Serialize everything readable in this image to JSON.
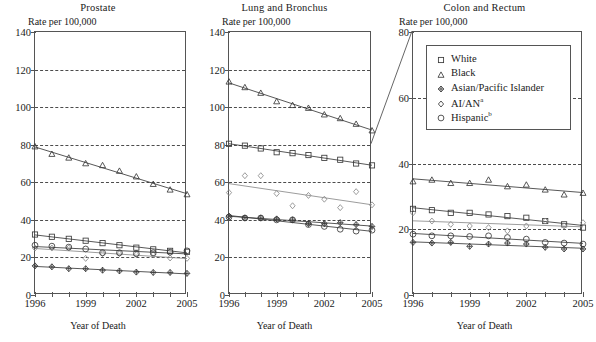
{
  "figure": {
    "width": 596,
    "height": 342,
    "axis_note": "Rate per 100,000",
    "xlabel": "Year of Death",
    "callout": "zoom-connector-lung-to-colon"
  },
  "legend": {
    "position": "top-right-inside-colon-panel",
    "items": [
      {
        "label": "White",
        "marker": "square",
        "key": "white"
      },
      {
        "label": "Black",
        "marker": "triangle",
        "key": "black"
      },
      {
        "label": "Asian/Pacific Islander",
        "marker": "diamond-cross",
        "key": "api"
      },
      {
        "label": "AI/AN",
        "marker": "diamond-small",
        "key": "aian",
        "footnote": "a"
      },
      {
        "label": "Hispanic",
        "marker": "circle",
        "key": "hispanic",
        "footnote": "b"
      }
    ]
  },
  "chart_data": [
    {
      "type": "line",
      "title": "Prostate",
      "xlabel": "Year of Death",
      "ylabel": "Rate per 100,000",
      "x": [
        1996,
        1997,
        1998,
        1999,
        2000,
        2001,
        2002,
        2003,
        2004,
        2005
      ],
      "xticks": [
        1996,
        1999,
        2002,
        2005
      ],
      "xlim": [
        1996,
        2005
      ],
      "ylim": [
        0,
        140
      ],
      "yticks": [
        0,
        20,
        40,
        60,
        80,
        100,
        120,
        140
      ],
      "grid": "horizontal-dashed-at-20-40-60-80-100-120",
      "series": [
        {
          "name": "White",
          "values": [
            32.2,
            31.0,
            29.9,
            28.9,
            27.6,
            26.5,
            25.2,
            24.3,
            23.5,
            23.0
          ]
        },
        {
          "name": "Black",
          "values": [
            79.0,
            75.0,
            73.0,
            70.0,
            69.0,
            66.0,
            63.0,
            59.0,
            56.0,
            53.5
          ]
        },
        {
          "name": "Asian/Pacific Islander",
          "values": [
            15.5,
            15.0,
            14.0,
            14.0,
            13.2,
            12.8,
            12.2,
            12.0,
            12.0,
            11.5
          ]
        },
        {
          "name": "AI/AN",
          "values": [
            25.0,
            25.0,
            25.0,
            19.5,
            22.0,
            22.0,
            21.5,
            21.5,
            19.7,
            19.5
          ]
        },
        {
          "name": "Hispanic",
          "values": [
            26.5,
            26.0,
            25.5,
            24.5,
            22.5,
            22.5,
            22.0,
            22.5,
            22.8,
            23.5
          ]
        }
      ]
    },
    {
      "type": "line",
      "title": "Lung and Bronchus",
      "xlabel": "Year of Death",
      "ylabel": "Rate per 100,000",
      "x": [
        1996,
        1997,
        1998,
        1999,
        2000,
        2001,
        2002,
        2003,
        2004,
        2005
      ],
      "xticks": [
        1996,
        1999,
        2002,
        2005
      ],
      "xlim": [
        1996,
        2005
      ],
      "ylim": [
        0,
        140
      ],
      "yticks": [
        0,
        20,
        40,
        60,
        80,
        100,
        120,
        140
      ],
      "grid": "horizontal-dashed-at-20-40-60-80-100-120",
      "series": [
        {
          "name": "White",
          "values": [
            80.5,
            79.5,
            78.0,
            76.0,
            75.5,
            74.5,
            73.0,
            72.0,
            70.0,
            69.0
          ]
        },
        {
          "name": "Black",
          "values": [
            113.5,
            110.5,
            107.5,
            103.0,
            101.0,
            99.5,
            96.0,
            94.0,
            91.0,
            87.5
          ]
        },
        {
          "name": "Asian/Pacific Islander",
          "values": [
            42.0,
            41.0,
            41.0,
            40.5,
            40.0,
            38.0,
            38.0,
            38.5,
            37.5,
            36.5
          ]
        },
        {
          "name": "AI/AN",
          "values": [
            54.5,
            63.5,
            63.5,
            54.0,
            47.5,
            53.0,
            51.0,
            46.5,
            55.0,
            48.0
          ]
        },
        {
          "name": "Hispanic",
          "values": [
            41.5,
            41.0,
            41.0,
            40.0,
            40.0,
            37.5,
            36.5,
            35.0,
            34.0,
            34.5
          ]
        }
      ]
    },
    {
      "type": "line",
      "title": "Colon and Rectum",
      "xlabel": "Year of Death",
      "ylabel": "Rate per 100,000",
      "x": [
        1996,
        1997,
        1998,
        1999,
        2000,
        2001,
        2002,
        2003,
        2004,
        2005
      ],
      "xticks": [
        1996,
        1999,
        2002,
        2005
      ],
      "xlim": [
        1996,
        2005
      ],
      "ylim": [
        0,
        80
      ],
      "yticks": [
        0,
        20,
        40,
        60,
        80
      ],
      "grid": "horizontal-dashed-at-20-40-60",
      "series": [
        {
          "name": "White",
          "values": [
            26.2,
            25.8,
            25.0,
            25.0,
            24.5,
            24.0,
            23.5,
            22.5,
            21.5,
            20.5
          ]
        },
        {
          "name": "Black",
          "values": [
            34.5,
            35.0,
            34.0,
            34.0,
            35.0,
            33.0,
            33.5,
            32.0,
            30.5,
            31.0
          ]
        },
        {
          "name": "Asian/Pacific Islander",
          "values": [
            16.0,
            15.8,
            16.0,
            14.8,
            15.5,
            15.8,
            15.5,
            14.5,
            14.0,
            14.0
          ]
        },
        {
          "name": "AI/AN",
          "values": [
            25.0,
            22.5,
            21.5,
            21.0,
            20.5,
            19.5,
            21.0,
            22.5,
            21.0,
            22.0
          ]
        },
        {
          "name": "Hispanic",
          "values": [
            18.5,
            18.0,
            18.0,
            17.8,
            18.0,
            17.5,
            17.0,
            16.0,
            15.8,
            15.5
          ]
        }
      ]
    }
  ]
}
